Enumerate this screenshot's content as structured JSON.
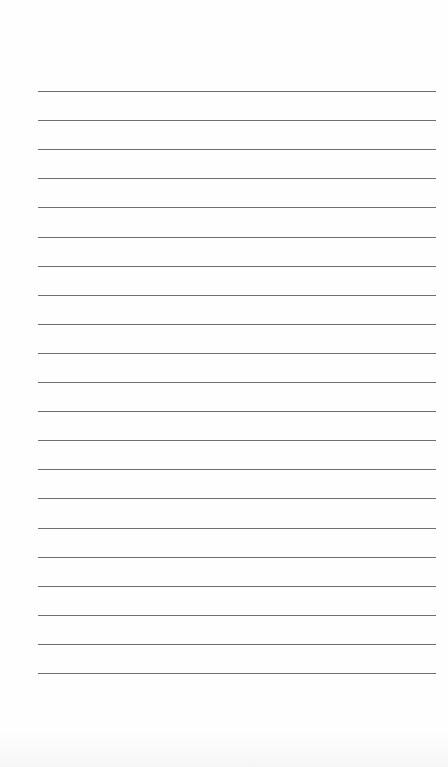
{
  "document": {
    "type": "lined-paper",
    "background_color": "#ffffff",
    "rule_color": "#6e6e6e",
    "rules": {
      "count": 21,
      "first_y": 91,
      "spacing": 29.1,
      "left": 38,
      "right": 436
    },
    "text": ""
  }
}
